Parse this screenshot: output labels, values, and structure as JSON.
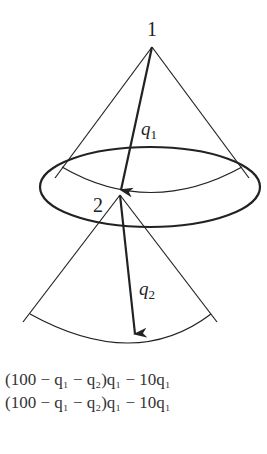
{
  "diagram": {
    "type": "game-tree",
    "nodes": [
      {
        "id": "1",
        "label": "1"
      },
      {
        "id": "2",
        "label": "2"
      }
    ],
    "edges": [
      {
        "from": "1",
        "to": "2",
        "label": "q",
        "subscript": "1"
      },
      {
        "from": "2",
        "to": "terminal",
        "label": "q",
        "subscript": "2"
      }
    ],
    "payoffs": [
      "(100 − q₁ − q₂)q₁ − 10q₁",
      "(100 − q₁ − q₂)q₁ − 10q₁"
    ],
    "colors": {
      "stroke": "#222222",
      "background": "#ffffff"
    }
  }
}
